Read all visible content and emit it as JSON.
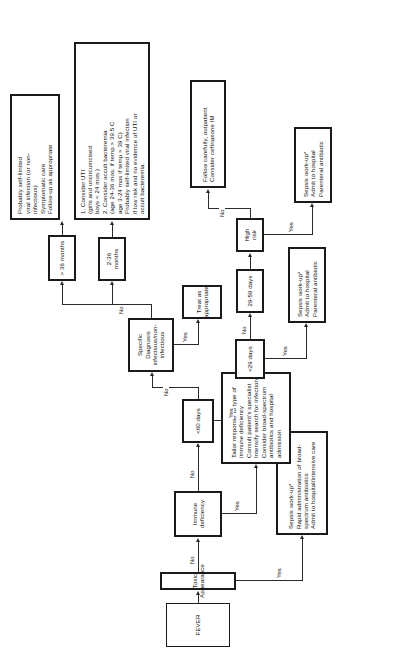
{
  "diagram": {
    "orientation": "page-rotated-90-ccw",
    "nodes": {
      "fever": "FEVER",
      "toxic_appearance": "Toxic Appearance",
      "immune_deficiency": "Immune\ndeficiency",
      "under_60_days": "<60 days",
      "specific_diagnosis": "Specific Diagnosis\ninfectious/non-infectious",
      "under_29_days": "<29 days",
      "days_29_59": "29-59 days",
      "high_risk": "High risk",
      "months_2_36": "2-36 months",
      "months_over_36": "> 36 months",
      "sepsis_toxic": "Sepsis work-up*\nRapid administration of broad-\nspectrum antibiotics\nAdmit to hospital/intensive care",
      "immune_mgmt": "Tailor response to type of\nimmune deficiency\nConsult patient's specialist\nIntensify search for infection\nConsider broad-spectrum\nantibiotics and hospital\nadmission",
      "sepsis_under29": "Sepsis work-up*\nAdmit to hospital\nParenteral antibiotic",
      "sepsis_highrisk": "Sepsis work-up*\nAdmit to hospital\nParenteral antibiotic",
      "follow_outpatient": "Follow carefully, outpatient\nConsider ceftriaxone IM",
      "treat_as_appropriate": "Treat as\nappropriate",
      "uti_box": "1. Consider UTI\n    (girls and uncircumcised\n    boys < 24 mos.)\n2. Consider occult bacteremia\n    (age 24-36 mos. if temp > 39.5 C\n     age 3-24 mos if temp > 39 C)\nProbably self-limited viral infection\nif low risk and no evidence of UTI or\noccult bacteremia.",
      "viral_box": "Probably self-limited\nviral infection (or non-\ninfectious)\nSymptomatic care\nFollow-up as appropriate"
    },
    "edge_labels": {
      "toxic_yes": "Yes",
      "toxic_no": "No",
      "immune_yes": "Yes",
      "immune_no": "No",
      "under60_yes": "Yes",
      "under60_no": "No",
      "diagnosis_yes": "Yes",
      "diagnosis_no": "No",
      "under29_yes": "Yes",
      "under29_no": "No",
      "highrisk_yes": "Yes",
      "highrisk_no": "No"
    },
    "colors": {
      "stroke": "#1a1a1a",
      "text": "#111111",
      "background": "#ffffff"
    }
  }
}
